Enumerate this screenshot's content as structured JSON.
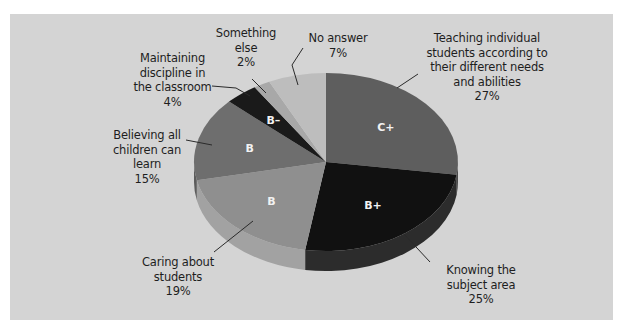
{
  "chart_data": {
    "type": "pie",
    "title": "",
    "style": "3d",
    "start_angle_deg": 0,
    "direction": "clockwise",
    "slices": [
      {
        "label": "Teaching individual students according to their different needs and abilities",
        "value": 27,
        "grade": "C+",
        "color": "#5e5e5e",
        "side_color": "#4a4a4a"
      },
      {
        "label": "Knowing the subject area",
        "value": 25,
        "grade": "B+",
        "color": "#111111",
        "side_color": "#2c2c2c"
      },
      {
        "label": "Caring about students",
        "value": 19,
        "grade": "B",
        "color": "#8f8f8f",
        "side_color": "#a2a2a2"
      },
      {
        "label": "Believing all children can learn",
        "value": 15,
        "grade": "B",
        "color": "#6e6e6e",
        "side_color": "#5c5c5c"
      },
      {
        "label": "Maintaining discipline in the classroom",
        "value": 4,
        "grade": "B–",
        "color": "#1a1a1a",
        "side_color": "#1a1a1a"
      },
      {
        "label": "Something else",
        "value": 2,
        "grade": "",
        "color": "#a8a8a8",
        "side_color": "#a8a8a8"
      },
      {
        "label": "No answer",
        "value": 7,
        "grade": "",
        "color": "#bdbdbd",
        "side_color": "#bdbdbd"
      }
    ],
    "unit": "%",
    "legend": "none (callout labels)"
  },
  "labels": {
    "teaching": "Teaching individual\nstudents according to\ntheir different needs\nand abilities\n27%",
    "knowing": "Knowing the\nsubject area\n25%",
    "caring": "Caring about\nstudents\n19%",
    "believing": "Believing all\nchildren can\nlearn\n15%",
    "discipline": "Maintaining\ndiscipline in\nthe classroom\n4%",
    "something": "Something\nelse\n2%",
    "no_answer": "No answer\n7%"
  },
  "colors": {
    "background": "#d4d4d4",
    "text": "#1e1e1e",
    "leader_line": "#2a2a2a"
  }
}
